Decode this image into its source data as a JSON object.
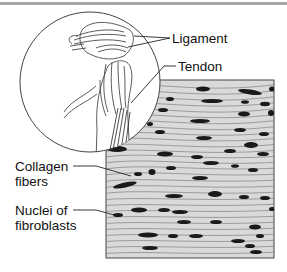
{
  "figure": {
    "labels": {
      "ligament": "Ligament",
      "tendon": "Tendon",
      "collagen_line1": "Collagen",
      "collagen_line2": "fibers",
      "nuclei_line1": "Nuclei of",
      "nuclei_line2": "fibroblasts"
    },
    "colors": {
      "rule": "#a8a8a8",
      "tissue_bg": "#d6d6d6",
      "fiber": "#6e6e6e",
      "nucleus": "#1a1a1a",
      "outline": "#333333"
    }
  }
}
